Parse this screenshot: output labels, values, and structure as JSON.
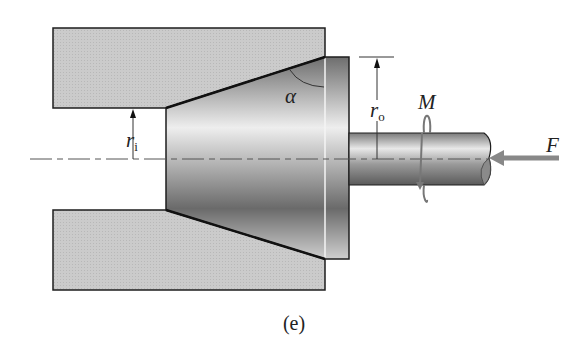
{
  "figure": {
    "caption": "(e)",
    "labels": {
      "alpha": "α",
      "r_i": {
        "main": "r",
        "sub": "i"
      },
      "r_o": {
        "main": "r",
        "sub": "o"
      },
      "moment": "M",
      "force": "F"
    },
    "colors": {
      "die_fill": "#c9c9c9",
      "outline": "#1e1e1e",
      "arrow_gray": "#8a8a8a",
      "centerline": "#555555"
    }
  }
}
